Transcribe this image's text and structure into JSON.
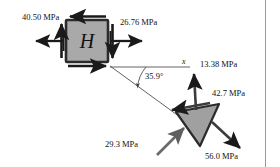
{
  "figure": {
    "type": "stress-element-diagram",
    "element_label": "H",
    "angle_label": "35.9°",
    "axis_label": "x",
    "colors": {
      "element_fill": "#a9a9a9",
      "element_stroke": "#2b2b2b",
      "arrow": "#1a1a1a",
      "wedge_fill": "#a0a0a0",
      "wedge_arrow": "#5f5f5f",
      "construction_line": "#3a3a3a",
      "border_rule": "#9a9a9a"
    },
    "square_element": {
      "name": "H",
      "left_stress": "40.50 MPa",
      "right_stress": "26.76 MPa"
    },
    "wedge_element": {
      "normal_stress": "13.38 MPa",
      "shear_stress": "42.7 MPa",
      "inclined_stress": "29.3 MPa",
      "resultant_stress": "56.0 MPa"
    },
    "labels": {
      "left": "40.50 MPa",
      "right": "26.76 MPa",
      "angle": "35.9°",
      "axis": "x",
      "up": "13.38 MPa",
      "shear": "42.7 MPa",
      "lower_left": "29.3 MPa",
      "lower_right": "56.0 MPa",
      "center": "H"
    }
  }
}
